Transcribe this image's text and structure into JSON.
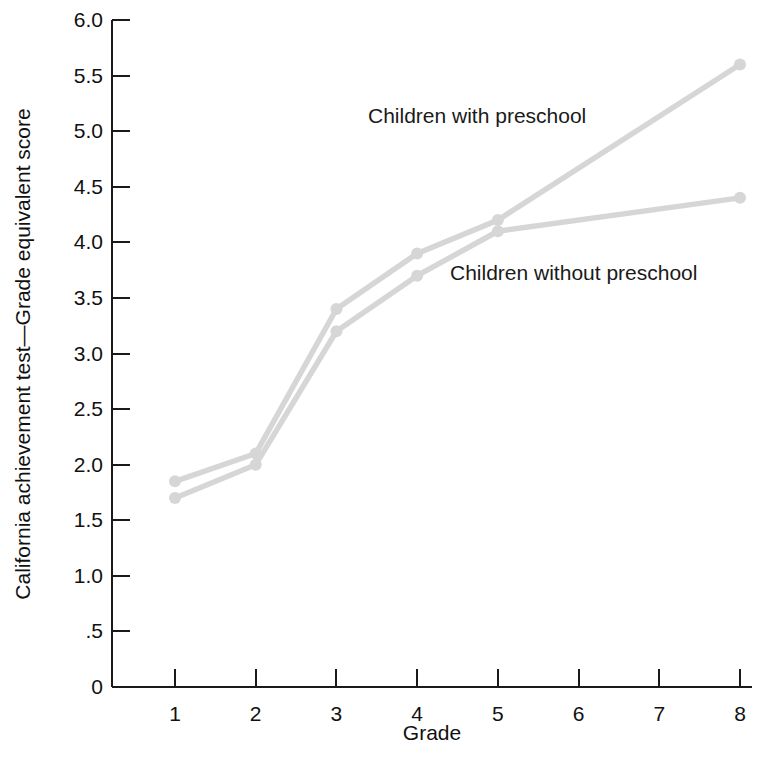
{
  "chart_data": {
    "type": "line",
    "title": "",
    "subtitle": "",
    "xlabel": "Grade",
    "ylabel": "California achievement test—Grade equivalent score",
    "x": [
      1,
      2,
      3,
      4,
      5,
      8
    ],
    "xlim": [
      1,
      8
    ],
    "ylim": [
      0,
      6.0
    ],
    "grid": false,
    "legend_position": "inline-annotations",
    "x_tick_labels": [
      "1",
      "2",
      "3",
      "4",
      "5",
      "6",
      "7",
      "8"
    ],
    "x_tick_values": [
      1,
      2,
      3,
      4,
      5,
      6,
      7,
      8
    ],
    "y_tick_labels": [
      "0",
      ".5",
      "1.0",
      "1.5",
      "2.0",
      "2.5",
      "3.0",
      "3.5",
      "4.0",
      "4.5",
      "5.0",
      "5.5",
      "6.0"
    ],
    "y_tick_values": [
      0,
      0.5,
      1.0,
      1.5,
      2.0,
      2.5,
      3.0,
      3.5,
      4.0,
      4.5,
      5.0,
      5.5,
      6.0
    ],
    "series": [
      {
        "name": "Children with preschool",
        "color": "#d6d6d6",
        "x": [
          1,
          2,
          3,
          4,
          5,
          8
        ],
        "values": [
          1.85,
          2.1,
          3.4,
          3.9,
          4.2,
          5.6
        ]
      },
      {
        "name": "Children without preschool",
        "color": "#d6d6d6",
        "x": [
          1,
          2,
          3,
          4,
          5,
          8
        ],
        "values": [
          1.7,
          2.0,
          3.2,
          3.7,
          4.1,
          4.4
        ]
      }
    ],
    "annotations": [
      {
        "text": "Children with preschool",
        "x_px": 368,
        "y_px": 123
      },
      {
        "text": "Children without preschool",
        "x_px": 450,
        "y_px": 280
      }
    ]
  },
  "axes": {
    "x_axis_label": "Grade",
    "y_axis_label": "California achievement test—Grade equivalent score"
  },
  "colors": {
    "series": "#d6d6d6",
    "axis": "#1a1a1a",
    "text": "#111111",
    "background": "#ffffff"
  }
}
